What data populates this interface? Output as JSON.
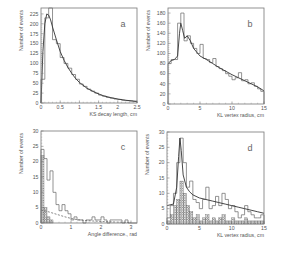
{
  "chart_data": [
    {
      "id": "a",
      "type": "bar",
      "panel_label": "a",
      "xlabel": "KS decay length, cm",
      "ylabel": "Number of events",
      "xlim": [
        0,
        2.5
      ],
      "ylim": [
        0,
        240
      ],
      "xticks": [
        0,
        0.5,
        1,
        1.5,
        2,
        2.5
      ],
      "xtick_labels": [
        "0",
        "0.5",
        "1",
        "1.5",
        "2",
        "2.5"
      ],
      "yticks": [
        0,
        25,
        50,
        75,
        100,
        125,
        150,
        175,
        200,
        225
      ],
      "ytick_labels": [
        "0",
        "25",
        "50",
        "75",
        "100",
        "125",
        "150",
        "175",
        "200",
        "225"
      ],
      "box": [
        41,
        8,
        137,
        103
      ],
      "histogram": {
        "bin_width": 0.1,
        "x": [
          0.0,
          0.1,
          0.2,
          0.3,
          0.4,
          0.5,
          0.6,
          0.7,
          0.8,
          0.9,
          1.0,
          1.1,
          1.2,
          1.3,
          1.4,
          1.5,
          1.6,
          1.7,
          1.8,
          1.9,
          2.0,
          2.1,
          2.2,
          2.3,
          2.4
        ],
        "values": [
          60,
          215,
          240,
          160,
          150,
          115,
          100,
          88,
          72,
          60,
          48,
          42,
          35,
          30,
          25,
          20,
          17,
          14,
          12,
          10,
          9,
          7,
          6,
          5,
          4
        ]
      },
      "fit_curve": {
        "x": [
          0.0,
          0.05,
          0.1,
          0.15,
          0.2,
          0.25,
          0.3,
          0.4,
          0.5,
          0.6,
          0.7,
          0.8,
          0.9,
          1.0,
          1.2,
          1.4,
          1.6,
          1.8,
          2.0,
          2.2,
          2.5
        ],
        "values": [
          0,
          130,
          200,
          225,
          222,
          210,
          192,
          160,
          130,
          108,
          90,
          75,
          62,
          52,
          37,
          27,
          19,
          14,
          10,
          7,
          4
        ]
      }
    },
    {
      "id": "b",
      "type": "bar",
      "panel_label": "b",
      "xlabel": "KL vertex radius, cm",
      "ylabel": "Number of events",
      "xlim": [
        0,
        15
      ],
      "ylim": [
        0,
        190
      ],
      "xticks": [
        0,
        5,
        10,
        15
      ],
      "xtick_labels": [
        "0",
        "5",
        "10",
        "15"
      ],
      "yticks": [
        0,
        20,
        40,
        60,
        80,
        100,
        120,
        140,
        160,
        180
      ],
      "ytick_labels": [
        "0",
        "20",
        "40",
        "60",
        "80",
        "100",
        "120",
        "140",
        "160",
        "180"
      ],
      "box": [
        168,
        8,
        264,
        104
      ],
      "histogram": {
        "bin_width": 0.5,
        "x": [
          0.0,
          0.5,
          1.0,
          1.5,
          2.0,
          2.5,
          3.0,
          3.5,
          4.0,
          4.5,
          5.0,
          5.5,
          6.0,
          6.5,
          7.0,
          7.5,
          8.0,
          8.5,
          9.0,
          9.5,
          10.0,
          10.5,
          11.0,
          11.5,
          12.0,
          12.5,
          13.0,
          13.5,
          14.0,
          14.5
        ],
        "values": [
          80,
          88,
          88,
          160,
          180,
          125,
          135,
          120,
          110,
          100,
          118,
          90,
          88,
          82,
          90,
          74,
          70,
          66,
          60,
          55,
          48,
          52,
          62,
          46,
          48,
          40,
          42,
          35,
          30,
          25
        ]
      },
      "fit_curve": {
        "x": [
          0.0,
          0.5,
          1.0,
          1.5,
          1.8,
          2.0,
          2.3,
          2.6,
          3.0,
          3.5,
          4.0,
          5.0,
          6.0,
          7.0,
          8.0,
          9.0,
          10.0,
          11.0,
          12.0,
          13.0,
          14.0,
          15.0
        ],
        "values": [
          80,
          86,
          88,
          95,
          140,
          160,
          145,
          130,
          135,
          125,
          110,
          95,
          88,
          80,
          72,
          65,
          58,
          52,
          46,
          40,
          34,
          26
        ]
      }
    },
    {
      "id": "c",
      "type": "bar",
      "panel_label": "c",
      "xlabel": "Angle difference., rad",
      "ylabel": "Number of events",
      "xlim": [
        0,
        3.2
      ],
      "ylim": [
        0,
        30
      ],
      "xticks": [
        0,
        1,
        2,
        3
      ],
      "xtick_labels": [
        "0",
        "1",
        "2",
        "3"
      ],
      "yticks": [
        0,
        5,
        10,
        15,
        20,
        25,
        30
      ],
      "ytick_labels": [
        "0",
        "5",
        "10",
        "15",
        "20",
        "25",
        "30"
      ],
      "box": [
        41,
        131,
        137,
        223
      ],
      "histogram_open": {
        "bin_width": 0.1,
        "x": [
          0.0,
          0.1,
          0.2,
          0.3,
          0.4,
          0.5,
          0.6,
          0.7,
          0.8,
          0.9,
          1.0,
          1.1,
          1.2,
          1.3,
          1.4,
          1.5,
          1.6,
          1.7,
          1.8,
          1.9,
          2.0,
          2.1,
          2.2,
          2.3,
          2.4,
          2.5,
          2.6,
          2.7,
          2.8,
          2.9,
          3.0,
          3.1
        ],
        "values": [
          24,
          21,
          14,
          17,
          10,
          6,
          4,
          6,
          4,
          3,
          1,
          2,
          1,
          1,
          0,
          1,
          1,
          2,
          1,
          1,
          2,
          1,
          0,
          1,
          1,
          1,
          1,
          0,
          1,
          0,
          0,
          0
        ]
      },
      "histogram_hatched": {
        "bin_width": 0.1,
        "x": [
          0.0,
          0.1,
          0.2,
          0.3
        ],
        "values": [
          22,
          5,
          2,
          1
        ]
      },
      "dashed_curve": {
        "x": [
          0.0,
          0.2,
          0.4,
          0.6,
          0.8,
          1.0,
          1.2,
          1.5,
          2.0,
          2.5,
          3.0
        ],
        "values": [
          4.2,
          3.8,
          3.2,
          2.6,
          2.0,
          1.5,
          1.1,
          0.8,
          0.5,
          0.3,
          0.2
        ]
      }
    },
    {
      "id": "d",
      "type": "bar",
      "panel_label": "d",
      "xlabel": "KL vertex radius, cm",
      "ylabel": "Number of events",
      "xlim": [
        0,
        15
      ],
      "ylim": [
        0,
        30
      ],
      "xticks": [
        0,
        5,
        10,
        15
      ],
      "xtick_labels": [
        "0",
        "5",
        "10",
        "15"
      ],
      "yticks": [
        0,
        5,
        10,
        15,
        20,
        25,
        30
      ],
      "ytick_labels": [
        "0",
        "5",
        "10",
        "15",
        "20",
        "25",
        "30"
      ],
      "box": [
        167,
        132,
        264,
        224
      ],
      "histogram_open": {
        "bin_width": 0.5,
        "x": [
          0.0,
          0.5,
          1.0,
          1.5,
          2.0,
          2.5,
          3.0,
          3.5,
          4.0,
          4.5,
          5.0,
          5.5,
          6.0,
          6.5,
          7.0,
          7.5,
          8.0,
          8.5,
          9.0,
          9.5,
          10.0,
          10.5,
          11.0,
          11.5,
          12.0,
          12.5,
          13.0,
          13.5,
          14.0,
          14.5
        ],
        "values": [
          2,
          6,
          10,
          20,
          28,
          20,
          12,
          14,
          8,
          7,
          5,
          8,
          12,
          5,
          6,
          9,
          6,
          10,
          8,
          5,
          6,
          4,
          2,
          3,
          6,
          4,
          3,
          2,
          2,
          3
        ]
      },
      "histogram_hatched": {
        "bin_width": 0.5,
        "x": [
          0.0,
          0.5,
          1.0,
          1.5,
          2.0,
          2.5,
          3.0,
          3.5,
          4.0,
          4.5,
          5.0,
          5.5,
          6.0,
          6.5,
          7.0,
          7.5,
          8.0,
          8.5,
          9.0,
          9.5,
          10.0,
          10.5,
          11.0,
          11.5,
          12.0,
          12.5,
          13.0,
          13.5,
          14.0,
          14.5
        ],
        "values": [
          1,
          3,
          6,
          8,
          14,
          10,
          6,
          4,
          2,
          3,
          1,
          2,
          3,
          1,
          2,
          1,
          2,
          3,
          1,
          1,
          2,
          1,
          1,
          1,
          2,
          1,
          1,
          1,
          1,
          1
        ]
      },
      "fit_curve": {
        "x": [
          0.0,
          1.0,
          1.5,
          1.8,
          2.0,
          2.2,
          2.5,
          3.0,
          3.5,
          4.0,
          5.0,
          6.0,
          7.0,
          8.0,
          9.0,
          10.0,
          11.0,
          12.0,
          13.0,
          14.0,
          15.0
        ],
        "values": [
          6,
          6.5,
          12,
          22,
          28,
          24,
          16,
          12,
          10.5,
          9.5,
          8.5,
          8,
          7.5,
          7,
          6.5,
          6,
          5.5,
          5,
          4.5,
          4,
          3.5
        ]
      }
    }
  ]
}
